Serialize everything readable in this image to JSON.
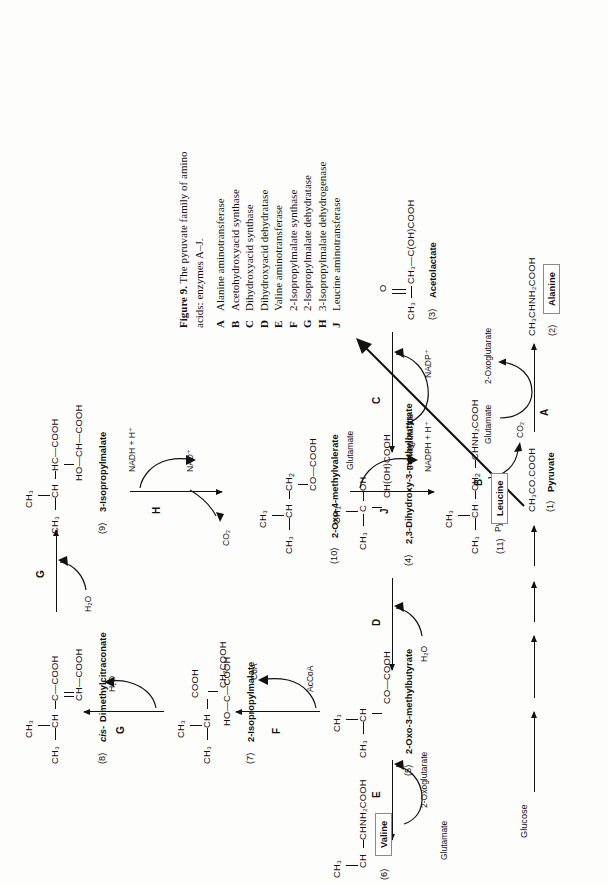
{
  "figure": {
    "caption_title": "Figure 9.",
    "caption_text": "The pyruvate family of amino acids: enzymes A–J.",
    "caption_line1": "The pyruvate family of amino",
    "caption_line2": "acids: enzymes A–J.",
    "enzymes": [
      {
        "letter": "A",
        "name": "Alanine aminotransferase"
      },
      {
        "letter": "B",
        "name": "Acetohydroxyacid synthase"
      },
      {
        "letter": "C",
        "name": "Dihydroxyacid synthase"
      },
      {
        "letter": "D",
        "name": "Dihydroxyacid dehydratase"
      },
      {
        "letter": "E",
        "name": "Valine aminotransferase"
      },
      {
        "letter": "F",
        "name": "2-Isopropylmalate synthase"
      },
      {
        "letter": "G",
        "name": "2-Isopropylmalate dehydratase"
      },
      {
        "letter": "H",
        "name": "3-Isopropylmalate dehydrogenase"
      },
      {
        "letter": "J",
        "name": "Leucine aminotransferase"
      }
    ]
  },
  "start": {
    "label": "Glucose"
  },
  "compounds": {
    "c1": {
      "number": "(1)",
      "name": "Pyruvate",
      "formula": "CH₃CO.COOH"
    },
    "c2": {
      "number": "(2)",
      "name": "Alanine",
      "formula": "CH₃CHNH₂COOH",
      "boxed": true
    },
    "c3": {
      "number": "(3)",
      "name": "Acetolactate",
      "formula": "CH₃—C(OH)COOH"
    },
    "c4": {
      "number": "(4)",
      "name": "2,3-Dihydroxy-3-methylbutyrate",
      "formula": "CH(OH)COOH"
    },
    "c5": {
      "number": "(5)",
      "name": "2-Oxo-3-methylbutyrate",
      "formula": "CO—COOH"
    },
    "c6": {
      "number": "(6)",
      "name": "Valine",
      "formula": "CHNH₂COOH",
      "boxed": true
    },
    "c7": {
      "number": "(7)",
      "name": "2-Isopropylmalate",
      "formula": "CH₂COOH"
    },
    "c8": {
      "number": "(8)",
      "name": "cis-Dimethylcitraconate",
      "formula": "CH—COOH",
      "italic_prefix": "cis-"
    },
    "c9": {
      "number": "(9)",
      "name": "3-Isopropylmalate",
      "formula": "HO—CH—COOH"
    },
    "c10": {
      "number": "(10)",
      "name": "2-Oxo-4-methylvalerate",
      "formula": "CO—COOH"
    },
    "c11": {
      "number": "(11)",
      "name": "Leucine",
      "formula": "CHNH₂COOH",
      "boxed": true
    }
  },
  "enzyme_labels": {
    "A": "A",
    "B": "B",
    "C": "C",
    "D": "D",
    "E": "E",
    "F": "F",
    "G": "G",
    "H": "H",
    "J": "J"
  },
  "cofactors": {
    "a_in": "Glutamate",
    "a_out": "2-Oxoglutarate",
    "b_in": "Pyruvate",
    "b_out": "CO₂",
    "c_in": "NADPH + H⁺",
    "c_out": "NADP⁺",
    "d_out": "H₂O",
    "e_in": "2-Oxoglutarate",
    "e_out": "Glutamate",
    "f_in": "AcCoA",
    "f_out": "CoA",
    "g1_out": "H₂O",
    "g2_out": "H₂O",
    "h_in": "NADH + H⁺",
    "h_out": "NAD⁺",
    "h_co2": "CO₂",
    "j_in": "Glutamate",
    "j_out": "2-Oxoglutarate"
  },
  "fragments": {
    "ch3": "CH₃",
    "ch": "CH",
    "c": "C",
    "hc": "HC",
    "ho": "HO",
    "oh": "OH",
    "o": "O",
    "cooh": "COOH",
    "ch2cooh": "CH₂COOH",
    "chohcooh": "CH(OH)COOH",
    "cocooh": "CO—COOH",
    "ccooh": "C—COOH",
    "chcooh": "CH—COOH",
    "hccooh": "HC—COOH",
    "hochcooh": "HO—CH—COOH",
    "ch3cohcooh": "CH₃—C(OH)COOH",
    "ch3co": "CH₃—C",
    "chnh2cooh": "CHNH₂COOH",
    "ch3chnh2cooh": "CH₃CHNH₂COOH",
    "ch3cocooh": "CH₃CO.COOH",
    "hocooh": "HO—C—COOH"
  },
  "colors": {
    "ink": "#111111",
    "paper": "#fdfdfc",
    "boxborder": "#8a8a8a"
  }
}
